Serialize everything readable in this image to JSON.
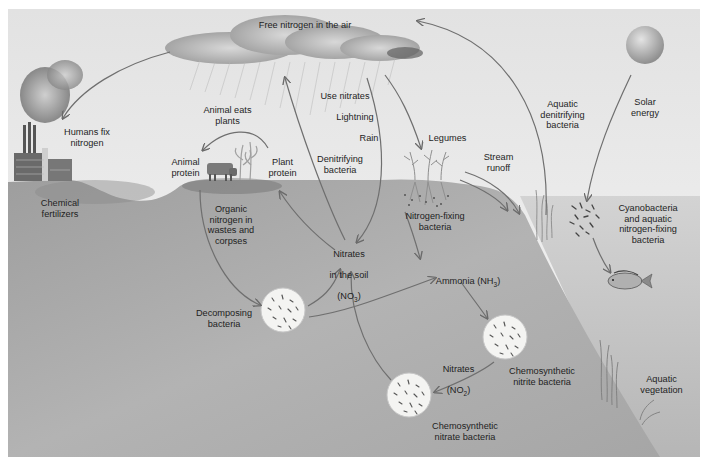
{
  "diagram": {
    "colors": {
      "sky": "#ececec",
      "soil": "#a9a9a9",
      "soil_dark": "#7f7f7f",
      "water": "#c4c4c4",
      "arrow": "#6f6f6f",
      "text": "#1e1e1e",
      "cloud": "#9a9a9a",
      "bacteria_disc": "#f4f4f2"
    },
    "labels": {
      "free_nitrogen": "Free nitrogen in the air",
      "humans_fix": "Humans fix\nnitrogen",
      "chemical_fertilizers": "Chemical\nfertilizers",
      "animal_eats_plants": "Animal eats\nplants",
      "animal_protein": "Animal\nprotein",
      "plant_protein": "Plant\nprotein",
      "use_nitrates": "Use nitrates",
      "lightning": "Lightning",
      "rain": "Rain",
      "denitrifying_bacteria": "Denitrifying\nbacteria",
      "legumes": "Legumes",
      "stream_runoff": "Stream\nrunoff",
      "aquatic_denitrifying": "Aquatic\ndenitrifying\nbacteria",
      "solar_energy": "Solar\nenergy",
      "organic_nitrogen": "Organic\nnitrogen in\nwastes and\ncorpses",
      "nitrates_soil_line1": "Nitrates",
      "nitrates_soil_line2": "in the soil",
      "nitrates_soil_formula": "(NO",
      "nitrates_soil_sub": "3",
      "nitrogen_fixing": "Nitrogen-fixing\nbacteria",
      "cyanobacteria": "Cyanobacteria\nand aquatic\nnitrogen-fixing\nbacteria",
      "ammonia": "Ammonia (NH",
      "ammonia_sub": "3",
      "decomposing_bacteria": "Decomposing\nbacteria",
      "nitrates_no2_line1": "Nitrates",
      "nitrates_no2_formula": "(NO",
      "nitrates_no2_sub": "2",
      "chemosynthetic_nitrite": "Chemosynthetic\nnitrite bacteria",
      "chemosynthetic_nitrate": "Chemosynthetic\nnitrate bacteria",
      "aquatic_vegetation": "Aquatic\nvegetation"
    },
    "nodes": [
      {
        "id": "air",
        "label": "Free nitrogen in the air"
      },
      {
        "id": "factory",
        "label": "Humans fix nitrogen"
      },
      {
        "id": "fertilizer",
        "label": "Chemical fertilizers"
      },
      {
        "id": "animal",
        "label": "Animal protein"
      },
      {
        "id": "plant",
        "label": "Plant protein"
      },
      {
        "id": "legumes",
        "label": "Legumes"
      },
      {
        "id": "nfix",
        "label": "Nitrogen-fixing bacteria"
      },
      {
        "id": "soil_nitrates",
        "label": "Nitrates in the soil (NO3)"
      },
      {
        "id": "ammonia",
        "label": "Ammonia (NH3)"
      },
      {
        "id": "decomposers",
        "label": "Decomposing bacteria"
      },
      {
        "id": "nitrite_bact",
        "label": "Chemosynthetic nitrite bacteria"
      },
      {
        "id": "nitrate_bact",
        "label": "Chemosynthetic nitrate bacteria"
      },
      {
        "id": "nitrates_no2",
        "label": "Nitrates (NO2)"
      },
      {
        "id": "aquatic_denit",
        "label": "Aquatic denitrifying bacteria"
      },
      {
        "id": "sun",
        "label": "Solar energy"
      },
      {
        "id": "cyano",
        "label": "Cyanobacteria and aquatic nitrogen-fixing bacteria"
      },
      {
        "id": "fish",
        "label": "Fish"
      },
      {
        "id": "aq_veg",
        "label": "Aquatic vegetation"
      }
    ],
    "edges": [
      {
        "from": "air",
        "to": "factory"
      },
      {
        "from": "plant",
        "to": "animal",
        "label": "Animal eats plants"
      },
      {
        "from": "animal",
        "to": "decomposers",
        "label": "Organic nitrogen in wastes and corpses"
      },
      {
        "from": "decomposers",
        "to": "soil_nitrates"
      },
      {
        "from": "decomposers",
        "to": "ammonia"
      },
      {
        "from": "soil_nitrates",
        "to": "plant"
      },
      {
        "from": "soil_nitrates",
        "to": "air",
        "label": "Denitrifying bacteria"
      },
      {
        "from": "air",
        "to": "soil_nitrates",
        "label": "Use nitrates / Lightning / Rain"
      },
      {
        "from": "air",
        "to": "legumes"
      },
      {
        "from": "nfix",
        "to": "ammonia"
      },
      {
        "from": "ammonia",
        "to": "nitrite_bact"
      },
      {
        "from": "nitrite_bact",
        "to": "nitrate_bact",
        "label": "Nitrates (NO2)"
      },
      {
        "from": "nitrate_bact",
        "to": "soil_nitrates"
      },
      {
        "from": "legumes",
        "to": "aq_veg",
        "label": "Stream runoff"
      },
      {
        "from": "aquatic_denit",
        "to": "air"
      },
      {
        "from": "sun",
        "to": "cyano",
        "label": "Solar energy"
      },
      {
        "from": "cyano",
        "to": "fish"
      }
    ]
  }
}
